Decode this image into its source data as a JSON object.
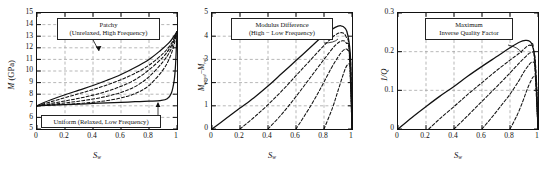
{
  "figure": {
    "panel_count": 3,
    "curve_count_per_panel": 5,
    "line_color": "#111111",
    "grid_color": "#9a9a9a",
    "background": "#ffffff"
  },
  "panels": [
    {
      "id": "panel-modulus",
      "ylabel_main": "M",
      "ylabel_unit": "(GPa)",
      "xlabel": "S",
      "xlabel_sub": "w",
      "yticks": [
        "5",
        "6",
        "7",
        "8",
        "9",
        "10",
        "11",
        "12",
        "13",
        "14",
        "15"
      ],
      "xticks": [
        "0",
        "0.2",
        "0.4",
        "0.6",
        "0.8",
        "1"
      ],
      "annotations": [
        {
          "name": "patchy-label",
          "line1": "Patchy",
          "line2": "(Unrelaxed, High Frequency)"
        },
        {
          "name": "uniform-label",
          "line1": "Uniform (Relaxed, Low Frequency)",
          "line2": ""
        }
      ]
    },
    {
      "id": "panel-modulus-difference",
      "ylabel_main": "M",
      "ylabel_sub1": "unrel",
      "ylabel_dash": "−",
      "ylabel_main2": "M",
      "ylabel_sub2": "rel",
      "ylabel_unit": "",
      "xlabel": "S",
      "xlabel_sub": "w",
      "yticks": [
        "0",
        "1",
        "2",
        "3",
        "4",
        "5"
      ],
      "xticks": [
        "0",
        "0.2",
        "0.4",
        "0.6",
        "0.8",
        "1"
      ],
      "annotations": [
        {
          "name": "modulus-difference-label",
          "line1": "Modulus Difference",
          "line2": "(High − Low Frequency)"
        }
      ]
    },
    {
      "id": "panel-inverse-quality",
      "ylabel_main": "1/Q",
      "ylabel_unit": "",
      "xlabel": "S",
      "xlabel_sub": "w",
      "yticks": [
        "0",
        "0.1",
        "0.2",
        "0.3"
      ],
      "xticks": [
        "0",
        "0.2",
        "0.4",
        "0.6",
        "0.8",
        "1"
      ],
      "annotations": [
        {
          "name": "max-inverse-quality-label",
          "line1": "Maximum",
          "line2": "Inverse Quality Factor"
        }
      ]
    }
  ],
  "chart_data": [
    {
      "type": "line",
      "title": "",
      "xlabel": "Sw",
      "ylabel": "M (GPa)",
      "xlim": [
        0,
        1
      ],
      "ylim": [
        5,
        15
      ],
      "xticks": [
        0,
        0.2,
        0.4,
        0.6,
        0.8,
        1
      ],
      "yticks": [
        5,
        6,
        7,
        8,
        9,
        10,
        11,
        12,
        13,
        14,
        15
      ],
      "grid": true,
      "legend": "none",
      "annotations": [
        "Patchy (Unrelaxed, High Frequency)",
        "Uniform (Relaxed, Low Frequency)"
      ],
      "series": [
        {
          "name": "Patchy (Unrelaxed, High Frequency)",
          "style": "solid",
          "x": [
            0,
            0.05,
            0.1,
            0.2,
            0.3,
            0.4,
            0.5,
            0.6,
            0.7,
            0.8,
            0.88,
            0.94,
            0.97,
            0.99,
            1.0
          ],
          "y": [
            7.0,
            7.28,
            7.52,
            7.95,
            8.35,
            8.75,
            9.2,
            9.7,
            10.3,
            11.0,
            11.75,
            12.4,
            12.85,
            13.2,
            13.4
          ]
        },
        {
          "name": "Uniform (Relaxed, Low Frequency)",
          "style": "solid",
          "x": [
            0,
            0.1,
            0.2,
            0.3,
            0.4,
            0.5,
            0.6,
            0.7,
            0.8,
            0.88,
            0.93,
            0.96,
            0.98,
            0.99,
            1.0
          ],
          "y": [
            7.0,
            7.05,
            7.1,
            7.15,
            7.2,
            7.25,
            7.3,
            7.35,
            7.4,
            7.45,
            7.6,
            8.1,
            9.2,
            10.6,
            13.4
          ]
        },
        {
          "name": "Intermediate frequency curve 1",
          "style": "dashed",
          "x": [
            0,
            0.1,
            0.2,
            0.3,
            0.4,
            0.5,
            0.6,
            0.7,
            0.8,
            0.9,
            0.95,
            0.98,
            1.0
          ],
          "y": [
            7.0,
            7.35,
            7.7,
            8.05,
            8.4,
            8.8,
            9.25,
            9.8,
            10.5,
            11.5,
            12.2,
            12.85,
            13.4
          ]
        },
        {
          "name": "Intermediate frequency curve 2",
          "style": "dashed",
          "x": [
            0,
            0.1,
            0.2,
            0.3,
            0.4,
            0.5,
            0.6,
            0.7,
            0.8,
            0.9,
            0.95,
            0.98,
            1.0
          ],
          "y": [
            7.0,
            7.2,
            7.42,
            7.65,
            7.92,
            8.25,
            8.68,
            9.25,
            10.1,
            11.2,
            12.0,
            12.7,
            13.4
          ]
        },
        {
          "name": "Intermediate frequency curve 3",
          "style": "dashed",
          "x": [
            0,
            0.1,
            0.2,
            0.3,
            0.4,
            0.5,
            0.6,
            0.7,
            0.8,
            0.9,
            0.95,
            0.98,
            1.0
          ],
          "y": [
            7.0,
            7.12,
            7.25,
            7.4,
            7.58,
            7.82,
            8.15,
            8.65,
            9.5,
            10.8,
            11.7,
            12.6,
            13.4
          ]
        },
        {
          "name": "Intermediate frequency curve 4",
          "style": "dashed",
          "x": [
            0,
            0.1,
            0.2,
            0.3,
            0.4,
            0.5,
            0.6,
            0.7,
            0.8,
            0.9,
            0.95,
            0.98,
            1.0
          ],
          "y": [
            7.0,
            7.06,
            7.13,
            7.2,
            7.3,
            7.45,
            7.68,
            8.05,
            8.75,
            10.1,
            11.2,
            12.3,
            13.4
          ]
        }
      ]
    },
    {
      "type": "line",
      "title": "",
      "xlabel": "Sw",
      "ylabel": "Munrel - Mrel",
      "xlim": [
        0,
        1
      ],
      "ylim": [
        0,
        5
      ],
      "xticks": [
        0,
        0.2,
        0.4,
        0.6,
        0.8,
        1
      ],
      "yticks": [
        0,
        1,
        2,
        3,
        4,
        5
      ],
      "grid": true,
      "legend": "none",
      "annotations": [
        "Modulus Difference (High − Low Frequency)"
      ],
      "series": [
        {
          "name": "Full modulus difference",
          "style": "solid",
          "x": [
            0,
            0.1,
            0.2,
            0.3,
            0.4,
            0.5,
            0.6,
            0.7,
            0.8,
            0.88,
            0.92,
            0.95,
            0.97,
            0.99,
            1.0
          ],
          "y": [
            0,
            0.45,
            0.9,
            1.35,
            1.85,
            2.4,
            2.95,
            3.5,
            4.05,
            4.38,
            4.45,
            4.35,
            4.05,
            3.0,
            0
          ]
        },
        {
          "name": "Dispersion curve 1",
          "style": "dashed",
          "x": [
            0.2,
            0.3,
            0.4,
            0.5,
            0.6,
            0.7,
            0.8,
            0.88,
            0.93,
            0.96,
            0.98,
            1.0
          ],
          "y": [
            0,
            0.5,
            1.05,
            1.65,
            2.3,
            2.95,
            3.6,
            4.05,
            4.15,
            3.95,
            3.4,
            0
          ]
        },
        {
          "name": "Dispersion curve 2",
          "style": "dashed",
          "x": [
            0.4,
            0.5,
            0.6,
            0.7,
            0.8,
            0.88,
            0.93,
            0.96,
            0.98,
            1.0
          ],
          "y": [
            0,
            0.65,
            1.4,
            2.2,
            3.0,
            3.6,
            3.8,
            3.7,
            3.3,
            0
          ]
        },
        {
          "name": "Dispersion curve 3",
          "style": "dashed",
          "x": [
            0.6,
            0.7,
            0.78,
            0.85,
            0.9,
            0.94,
            0.97,
            0.99,
            1.0
          ],
          "y": [
            0,
            0.95,
            1.8,
            2.6,
            3.1,
            3.4,
            3.4,
            2.9,
            0
          ]
        },
        {
          "name": "Dispersion curve 4",
          "style": "dashed",
          "x": [
            0.8,
            0.86,
            0.9,
            0.94,
            0.96,
            0.98,
            0.99,
            1.0
          ],
          "y": [
            0,
            0.9,
            1.65,
            2.4,
            2.7,
            2.8,
            2.5,
            0
          ]
        }
      ]
    },
    {
      "type": "line",
      "title": "",
      "xlabel": "Sw",
      "ylabel": "1/Q",
      "xlim": [
        0,
        1
      ],
      "ylim": [
        0,
        0.3
      ],
      "xticks": [
        0,
        0.2,
        0.4,
        0.6,
        0.8,
        1
      ],
      "yticks": [
        0,
        0.1,
        0.2,
        0.3
      ],
      "grid": true,
      "legend": "none",
      "annotations": [
        "Maximum Inverse Quality Factor"
      ],
      "series": [
        {
          "name": "Maximum inverse quality factor",
          "style": "solid",
          "x": [
            0,
            0.1,
            0.2,
            0.3,
            0.4,
            0.5,
            0.6,
            0.7,
            0.8,
            0.87,
            0.91,
            0.94,
            0.96,
            0.98,
            1.0
          ],
          "y": [
            0,
            0.03,
            0.058,
            0.085,
            0.11,
            0.137,
            0.162,
            0.186,
            0.21,
            0.225,
            0.229,
            0.227,
            0.215,
            0.17,
            0.0
          ]
        },
        {
          "name": "Attenuation curve 1",
          "style": "dashed",
          "x": [
            0.22,
            0.3,
            0.4,
            0.5,
            0.6,
            0.7,
            0.8,
            0.87,
            0.92,
            0.95,
            0.97,
            1.0
          ],
          "y": [
            0,
            0.027,
            0.058,
            0.09,
            0.12,
            0.15,
            0.178,
            0.197,
            0.213,
            0.216,
            0.2,
            0.0
          ]
        },
        {
          "name": "Attenuation curve 2",
          "style": "dashed",
          "x": [
            0.4,
            0.48,
            0.56,
            0.64,
            0.72,
            0.8,
            0.87,
            0.92,
            0.95,
            0.98,
            1.0
          ],
          "y": [
            0,
            0.028,
            0.057,
            0.086,
            0.115,
            0.145,
            0.172,
            0.19,
            0.197,
            0.18,
            0.0
          ]
        },
        {
          "name": "Attenuation curve 3",
          "style": "dashed",
          "x": [
            0.6,
            0.67,
            0.74,
            0.8,
            0.86,
            0.9,
            0.94,
            0.96,
            0.98,
            1.0
          ],
          "y": [
            0,
            0.03,
            0.062,
            0.09,
            0.123,
            0.148,
            0.168,
            0.172,
            0.155,
            0.0
          ]
        },
        {
          "name": "Attenuation curve 4",
          "style": "dashed",
          "x": [
            0.8,
            0.85,
            0.89,
            0.92,
            0.95,
            0.97,
            0.99,
            1.0
          ],
          "y": [
            0,
            0.035,
            0.07,
            0.1,
            0.125,
            0.135,
            0.12,
            0.0
          ]
        }
      ]
    }
  ]
}
